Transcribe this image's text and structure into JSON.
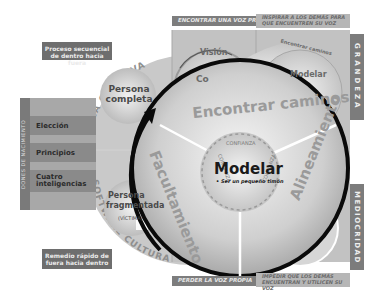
{
  "callouts": {
    "top_left": "Proceso secuencial de dentro hacia fuera",
    "bottom_left": "Remedio rápido de fuera hacia dentro"
  },
  "left_panel": {
    "vertical_label": "DONES DE NACIMIENTO",
    "items": [
      "Elección",
      "Principios",
      "Cuatro inteligencias"
    ]
  },
  "outer_arcs": {
    "top": "FUERZA CREATIVA",
    "bottom": "SOFTWARE CULTURAL"
  },
  "small_circles": {
    "complete": "Persona completa",
    "fragmented_line1": "Persona",
    "fragmented_line2": "fragmentada",
    "fragmented_sub": "(VÍCTIMA)"
  },
  "top_bands": {
    "left": "ENCONTRAR UNA VOZ PROPIA",
    "right": "INSPIRAR A LOS DEMÁS PARA QUE ENCUENTREN SU VOZ"
  },
  "bottom_bands": {
    "left": "PERDER LA VOZ PROPIA",
    "right": "IMPEDIR QUE LOS DEMÁS ENCUENTRAN Y UTILICEN SU VOZ"
  },
  "right_bars": {
    "top": "GRANDEZA",
    "top_sub": "(Liberar el potencial humano)",
    "bottom": "MEDIOCRIDAD",
    "bottom_sub": "(Restringir el potencial humano)"
  },
  "top_mini": {
    "left_title": "Visión",
    "left_sub": "Co",
    "right_arc": "Encontrar caminos",
    "right_title": "Modelar"
  },
  "main_wheel": {
    "center_title": "Modelar",
    "center_sub": "• Ser un pequeño timón",
    "trust_label": "CONFIANZA",
    "segments": [
      "Encontrar caminos",
      "Alineamiento",
      "Facultamiento"
    ]
  },
  "colors": {
    "dark_gray": "#6e6e6e",
    "mid_gray": "#9a9a9a",
    "light_gray": "#cfcfcf",
    "black_ring": "#0a0a0a"
  }
}
